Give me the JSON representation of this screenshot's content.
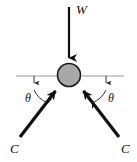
{
  "figure": {
    "type": "free-body-diagram",
    "title": "",
    "background_color": "#ffffff",
    "width": 137,
    "height": 162
  },
  "labels": {
    "weight": "W",
    "angle_left": "θ",
    "angle_right": "θ",
    "cable_left": "C",
    "cable_right": "C"
  },
  "colors": {
    "stroke": "#111111",
    "node_fill": "#a8a8a8",
    "node_stroke": "#1a1a1a",
    "reference_line": "#9a9a9a",
    "thin_stroke": "#1a1a1a"
  },
  "geometry": {
    "node": {
      "cx": 69,
      "cy": 75,
      "r": 11.5
    },
    "weight_arrow": {
      "x": 69,
      "y_start": 7,
      "y_end": 60
    },
    "reference_line_left": {
      "x1": 16,
      "x2": 58,
      "y": 76
    },
    "reference_line_right": {
      "x1": 82,
      "x2": 124,
      "y": 76
    },
    "tick_left": {
      "x": 34,
      "y_start": 76,
      "y_end": 84
    },
    "tick_right": {
      "x": 106,
      "y_start": 76,
      "y_end": 84
    },
    "cable_left_arrow": {
      "x_start": 20,
      "y_start": 137,
      "x_end": 58,
      "y_end": 88
    },
    "cable_right_arrow": {
      "x_start": 119,
      "y_start": 137,
      "x_end": 81,
      "y_end": 88
    },
    "angle_arc_left": {
      "cx": 34,
      "cy": 76,
      "r": 26
    },
    "angle_arc_right": {
      "cx": 106,
      "cy": 76,
      "r": 26
    }
  },
  "label_positions": {
    "weight": {
      "x": 76,
      "y": 14
    },
    "angle_left": {
      "x": 25,
      "y": 102
    },
    "angle_right": {
      "x": 108,
      "y": 102
    },
    "cable_left": {
      "x": 10,
      "y": 153
    },
    "cable_right": {
      "x": 121,
      "y": 153
    }
  },
  "description": {
    "summary": "Free body diagram of a node with a downward weight force W and two cable tension forces C acting upward at angle theta above the horizontal reference lines.",
    "forces": [
      {
        "name": "W",
        "direction": "down",
        "meaning": "weight"
      },
      {
        "name": "C",
        "direction": "up-right",
        "meaning": "cable tension left"
      },
      {
        "name": "C",
        "direction": "up-left",
        "meaning": "cable tension right"
      }
    ],
    "angles": [
      {
        "name": "θ",
        "side": "left",
        "measured_from": "horizontal"
      },
      {
        "name": "θ",
        "side": "right",
        "measured_from": "horizontal"
      }
    ]
  }
}
